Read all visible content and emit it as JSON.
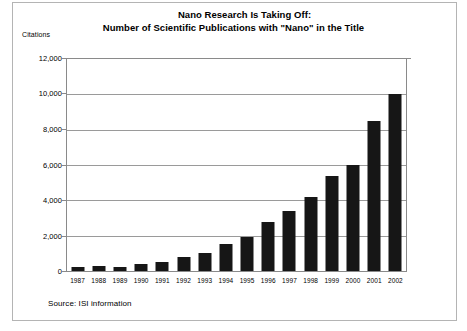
{
  "title": {
    "line1": "Nano Research Is Taking Off:",
    "line2": "Number of Scientific Publications with \"Nano\" in the Title"
  },
  "y_axis_caption": "Citations",
  "source_note": "Source: ISI information",
  "colors": {
    "bar": "#161616",
    "gridline": "#9a9a9a",
    "frame": "#8a8a8a",
    "text": "#000000",
    "background": "#ffffff"
  },
  "chart_data": {
    "type": "bar",
    "title": "Nano Research Is Taking Off: Number of Scientific Publications with \"Nano\" in the Title",
    "xlabel": "",
    "ylabel": "Citations",
    "categories": [
      "1987",
      "1988",
      "1989",
      "1990",
      "1991",
      "1992",
      "1993",
      "1994",
      "1995",
      "1996",
      "1997",
      "1998",
      "1999",
      "2000",
      "2001",
      "2002"
    ],
    "values": [
      250,
      300,
      250,
      400,
      500,
      800,
      1000,
      1500,
      1900,
      2800,
      3400,
      4200,
      5400,
      6000,
      8500,
      10000
    ],
    "ylim": [
      0,
      12000
    ],
    "ytick_values": [
      0,
      2000,
      4000,
      6000,
      8000,
      10000,
      12000
    ],
    "ytick_labels": [
      "0",
      "2,000",
      "4,000",
      "6,000",
      "8,000",
      "10,000",
      "12,000"
    ],
    "grid": true,
    "legend": false,
    "legend_position": "none",
    "annotations": [
      "Source: ISI information"
    ]
  }
}
